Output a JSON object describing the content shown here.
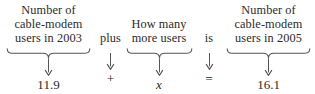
{
  "diagram": {
    "type": "word-equation",
    "colors": {
      "text": "#2b2b2b",
      "rule": "#555555",
      "background": "#ffffff"
    },
    "columns": [
      {
        "kind": "phrase",
        "id": "term-left",
        "lines": [
          "Number of",
          "cable-modem",
          "users in 2003"
        ],
        "has_brace": true,
        "arrow": "down-arrow",
        "value": "11.9",
        "value_style": "number"
      },
      {
        "kind": "connector",
        "id": "operator-plus",
        "lines": [
          "plus"
        ],
        "has_brace": false,
        "arrow": "down-arrow",
        "value": "+",
        "value_style": "operator"
      },
      {
        "kind": "phrase",
        "id": "term-unknown",
        "lines": [
          "How many",
          "more users"
        ],
        "has_brace": true,
        "arrow": "down-arrow",
        "value": "x",
        "value_style": "variable"
      },
      {
        "kind": "connector",
        "id": "operator-is",
        "lines": [
          "is"
        ],
        "has_brace": false,
        "arrow": "down-arrow",
        "value": "=",
        "value_style": "operator"
      },
      {
        "kind": "phrase",
        "id": "term-right",
        "lines": [
          "Number of",
          "cable-modem",
          "users in 2005"
        ],
        "has_brace": true,
        "arrow": "down-arrow",
        "value": "16.1",
        "value_style": "number"
      }
    ],
    "equation": "11.9 + x = 16.1"
  }
}
